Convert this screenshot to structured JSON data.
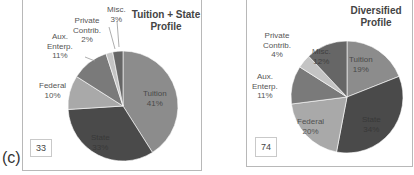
{
  "figure_label": "(c)",
  "chart_data": [
    {
      "type": "pie",
      "title": "Tuition + State Profile",
      "title_lines": [
        "Tuition + State",
        "Profile"
      ],
      "box_number": "33",
      "categories": [
        "Tuition",
        "State",
        "Federal",
        "Aux. Enterp.",
        "Private Contrib.",
        "Misc."
      ],
      "values": [
        41,
        33,
        10,
        11,
        2,
        3
      ],
      "labels": [
        {
          "name": [
            "Tuition"
          ],
          "pct": "41%"
        },
        {
          "name": [
            "State"
          ],
          "pct": "33%"
        },
        {
          "name": [
            "Federal"
          ],
          "pct": "10%"
        },
        {
          "name": [
            "Aux.",
            "Enterp."
          ],
          "pct": "11%"
        },
        {
          "name": [
            "Private",
            "Contrib."
          ],
          "pct": "2%"
        },
        {
          "name": [
            "Misc."
          ],
          "pct": "3%"
        }
      ],
      "colors": [
        "#8c8c8c",
        "#4a4a4a",
        "#a9a9a9",
        "#7a7a7a",
        "#c4c4c4",
        "#666666"
      ]
    },
    {
      "type": "pie",
      "title": "Diversified Profile",
      "title_lines": [
        "Diversified",
        "Profile"
      ],
      "box_number": "74",
      "categories": [
        "Tuition",
        "State",
        "Federal",
        "Aux. Enterp.",
        "Private Contrib.",
        "Misc."
      ],
      "values": [
        19,
        34,
        20,
        11,
        4,
        12
      ],
      "labels": [
        {
          "name": [
            "Tuition"
          ],
          "pct": "19%"
        },
        {
          "name": [
            "State"
          ],
          "pct": "34%"
        },
        {
          "name": [
            "Federal"
          ],
          "pct": "20%"
        },
        {
          "name": [
            "Aux.",
            "Enterp."
          ],
          "pct": "11%"
        },
        {
          "name": [
            "Private",
            "Contrib."
          ],
          "pct": "4%"
        },
        {
          "name": [
            "Misc."
          ],
          "pct": "12%"
        }
      ],
      "colors": [
        "#8c8c8c",
        "#4a4a4a",
        "#a9a9a9",
        "#7a7a7a",
        "#c4c4c4",
        "#666666"
      ]
    }
  ]
}
